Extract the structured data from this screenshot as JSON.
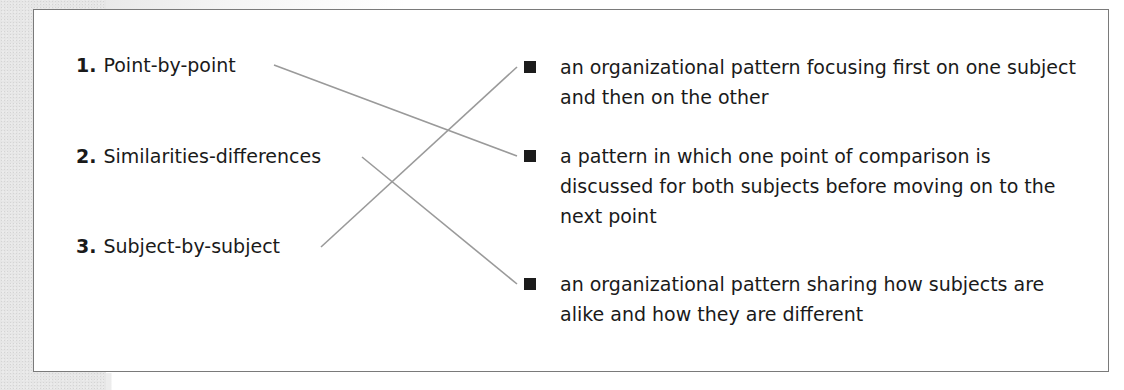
{
  "exercise": {
    "terms": [
      {
        "number": "1.",
        "label": "Point-by-point"
      },
      {
        "number": "2.",
        "label": "Similarities-differences"
      },
      {
        "number": "3.",
        "label": "Subject-by-subject"
      }
    ],
    "definitions": [
      {
        "bullet_icon": "black-square-icon",
        "text": "an organizational pattern focusing first on one subject and then on the other"
      },
      {
        "bullet_icon": "black-square-icon",
        "text": "a pattern in which one point of comparison is discussed for both subjects before moving on to the next point"
      },
      {
        "bullet_icon": "black-square-icon",
        "text": "an organizational pattern sharing how subjects are alike and how they are different"
      }
    ],
    "matches": [
      {
        "term": 1,
        "definition": 2
      },
      {
        "term": 2,
        "definition": 3
      },
      {
        "term": 3,
        "definition": 1
      }
    ],
    "colors": {
      "line": "#9a9a9a",
      "border": "#7a7a7a",
      "bullet": "#1c1c1c",
      "text": "#1a1a1a"
    }
  }
}
